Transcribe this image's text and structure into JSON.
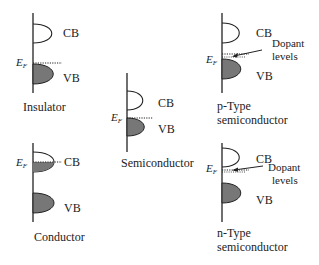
{
  "labels": {
    "cb": "CB",
    "vb": "VB",
    "ef_main": "E",
    "ef_sub": "F",
    "dopant_line1": "Dopant",
    "dopant_line2": "levels"
  },
  "panels": [
    {
      "id": "insulator",
      "caption_lines": [
        "Insulator"
      ]
    },
    {
      "id": "conductor",
      "caption_lines": [
        "Conductor"
      ]
    },
    {
      "id": "semiconductor",
      "caption_lines": [
        "Semiconductor"
      ]
    },
    {
      "id": "p-type",
      "caption_lines": [
        "p-Type",
        "semiconductor"
      ]
    },
    {
      "id": "n-type",
      "caption_lines": [
        "n-Type",
        "semiconductor"
      ]
    }
  ],
  "colors": {
    "line": "#222222",
    "fill": "#777777"
  }
}
